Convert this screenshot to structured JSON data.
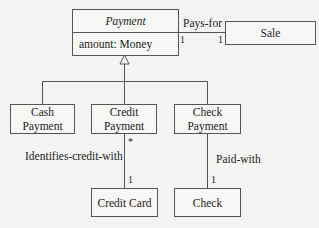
{
  "diagram": {
    "type": "UML class diagram",
    "classes": {
      "payment": {
        "name": "Payment",
        "abstract": true,
        "attributes": [
          "amount: Money"
        ]
      },
      "sale": {
        "name": "Sale"
      },
      "cash_payment": {
        "name": "Cash\nPayment",
        "line1": "Cash",
        "line2": "Payment"
      },
      "credit_payment": {
        "name": "Credit\nPayment",
        "line1": "Credit",
        "line2": "Payment"
      },
      "check_payment": {
        "name": "Check\nPayment",
        "line1": "Check",
        "line2": "Payment"
      },
      "credit_card": {
        "name": "Credit Card"
      },
      "check": {
        "name": "Check"
      }
    },
    "associations": [
      {
        "name": "Pays-for",
        "from": "Payment",
        "to": "Sale",
        "from_mult": "1",
        "to_mult": "1"
      },
      {
        "name": "Identifies-credit-with",
        "from": "Credit Payment",
        "to": "Credit Card",
        "from_mult": "*",
        "to_mult": "1"
      },
      {
        "name": "Paid-with",
        "from": "Check Payment",
        "to": "Check",
        "to_mult": "1"
      }
    ],
    "generalization": {
      "parent": "Payment",
      "children": [
        "Cash Payment",
        "Credit Payment",
        "Check Payment"
      ]
    }
  }
}
